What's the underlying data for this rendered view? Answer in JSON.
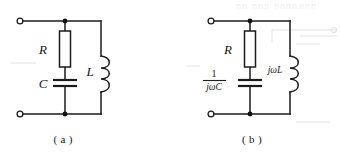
{
  "figure": {
    "background_color": "#ffffff",
    "ink_color": "#1b1b1b",
    "circuits": [
      {
        "caption": "( a )",
        "domain": "time-domain",
        "components": [
          {
            "id": "R-a",
            "type": "resistor",
            "label": "R",
            "label_side": "left"
          },
          {
            "id": "C-a",
            "type": "capacitor",
            "label": "C",
            "label_side": "left"
          },
          {
            "id": "L-a",
            "type": "inductor",
            "label": "L",
            "label_side": "left",
            "coil_turns": 3
          }
        ],
        "terminals": [
          {
            "id": "top-left-terminal-a",
            "style": "open-circle",
            "position": "top-left"
          },
          {
            "id": "bottom-left-terminal-a",
            "style": "open-circle",
            "position": "bottom-left"
          }
        ],
        "nodes": [
          {
            "id": "top-node-a",
            "style": "solid-dot"
          },
          {
            "id": "bottom-node-a",
            "style": "solid-dot"
          }
        ]
      },
      {
        "caption": "( b )",
        "domain": "phasor-domain",
        "components": [
          {
            "id": "R-b",
            "type": "resistor",
            "label": "R",
            "label_side": "left"
          },
          {
            "id": "C-b",
            "type": "capacitor",
            "label_numerator": "1",
            "label_denominator": "jωC",
            "label_side": "left",
            "label_style": "fraction"
          },
          {
            "id": "L-b",
            "type": "inductor",
            "label": "jωL",
            "label_side": "left",
            "coil_turns": 3
          }
        ],
        "terminals": [
          {
            "id": "top-left-terminal-b",
            "style": "open-circle",
            "position": "top-left"
          },
          {
            "id": "bottom-left-terminal-b",
            "style": "open-circle",
            "position": "bottom-left"
          }
        ],
        "nodes": [
          {
            "id": "top-node-b",
            "style": "solid-dot"
          },
          {
            "id": "bottom-node-b",
            "style": "solid-dot"
          }
        ]
      }
    ],
    "labels": {
      "r_a": "R",
      "c_a": "C",
      "l_a": "L",
      "r_b": "R",
      "c_b_numerator": "1",
      "c_b_denominator": "jωC",
      "l_b": "jωL",
      "caption_a": "( a )",
      "caption_b": "( b )"
    },
    "scan_artifacts": {
      "top_right_bleed": "กกก กกกกกก",
      "visible": true
    }
  }
}
